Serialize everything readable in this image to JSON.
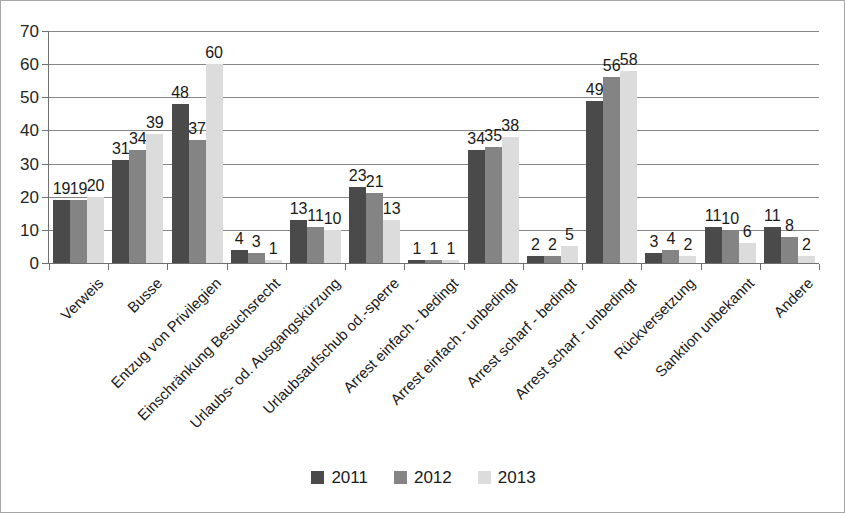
{
  "chart_data": {
    "type": "bar",
    "title": "",
    "subtitle": "",
    "xlabel": "",
    "ylabel": "",
    "ylim": [
      0,
      70
    ],
    "ytick_step": 10,
    "yticks": [
      0,
      10,
      20,
      30,
      40,
      50,
      60,
      70
    ],
    "grid": true,
    "legend_position": "bottom",
    "orientation": "vertical",
    "grouping": "clustered",
    "categories": [
      "Verweis",
      "Busse",
      "Entzug von Privilegien",
      "Einschränkung Besuchsrecht",
      "Urlaubs- od. Ausgangskürzung",
      "Urlaubsaufschub od.-sperre",
      "Arrest einfach - bedingt",
      "Arrest einfach - unbedingt",
      "Arrest scharf - bedingt",
      "Arrest scharf - unbedingt",
      "Rückversetzung",
      "Sanktion unbekannt",
      "Andere"
    ],
    "series": [
      {
        "name": "2011",
        "color": "#4a4a4a",
        "values": [
          19,
          31,
          48,
          4,
          13,
          23,
          1,
          34,
          2,
          49,
          3,
          11,
          11
        ]
      },
      {
        "name": "2012",
        "color": "#848484",
        "values": [
          19,
          34,
          37,
          3,
          11,
          21,
          1,
          35,
          2,
          56,
          4,
          10,
          8
        ]
      },
      {
        "name": "2013",
        "color": "#dcdcdc",
        "values": [
          20,
          39,
          60,
          1,
          10,
          13,
          1,
          38,
          5,
          58,
          2,
          6,
          2
        ]
      }
    ]
  },
  "legend": {
    "items": [
      {
        "label": "2011",
        "swatch": "s2011"
      },
      {
        "label": "2012",
        "swatch": "s2012"
      },
      {
        "label": "2013",
        "swatch": "s2013"
      }
    ]
  },
  "colors": {
    "series_2011": "#4a4a4a",
    "series_2012": "#848484",
    "series_2013": "#dcdcdc",
    "gridline": "#868686",
    "axis": "#6f6f6f",
    "border": "#a6a6a6",
    "text": "#1a1a1a",
    "background": "#ffffff"
  }
}
